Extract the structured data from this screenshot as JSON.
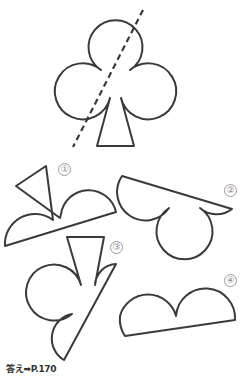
{
  "puzzle": {
    "main_figure": "club-suit-with-dashed-cut-line",
    "options": [
      {
        "id": 1,
        "label": "①"
      },
      {
        "id": 2,
        "label": "②"
      },
      {
        "id": 3,
        "label": "③"
      },
      {
        "id": 4,
        "label": "④"
      }
    ],
    "answer_ref": "答え➡P.170"
  },
  "colors": {
    "stroke": "#3a3a3a",
    "label": "#888888",
    "background": "#ffffff"
  }
}
